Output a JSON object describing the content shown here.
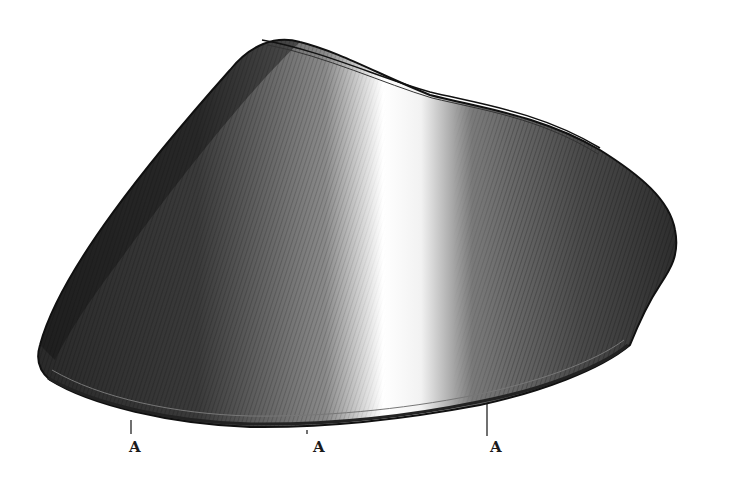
{
  "figure": {
    "style": "black-and-white line engraving with hatching",
    "colors": {
      "ink": "#1a1a1a",
      "paper": "#ffffff"
    },
    "labels": [
      {
        "id": "a1",
        "text": "A"
      },
      {
        "id": "a2",
        "text": "A"
      },
      {
        "id": "a3",
        "text": "A"
      }
    ]
  }
}
